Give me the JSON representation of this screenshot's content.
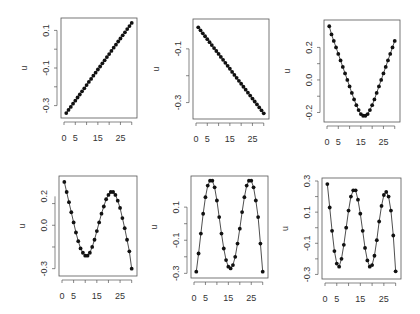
{
  "chart_data": [
    {
      "type": "line",
      "panel": 1,
      "title": "",
      "xlabel": "",
      "ylabel": "u",
      "x_ticks": [
        "0",
        "5",
        "15",
        "25"
      ],
      "y_ticks": [
        "-0.3",
        "-0.1",
        "0.1"
      ],
      "xlim": [
        0,
        31
      ],
      "ylim": [
        -0.35,
        0.15
      ],
      "box": [
        61,
        18,
        137,
        118
      ],
      "x": [
        1,
        2,
        3,
        4,
        5,
        6,
        7,
        8,
        9,
        10,
        11,
        12,
        13,
        14,
        15,
        16,
        17,
        18,
        19,
        20,
        21,
        22,
        23,
        24,
        25,
        26,
        27,
        28,
        29,
        30
      ],
      "values": [
        -0.34,
        -0.323,
        -0.307,
        -0.29,
        -0.274,
        -0.257,
        -0.241,
        -0.224,
        -0.208,
        -0.191,
        -0.174,
        -0.158,
        -0.141,
        -0.125,
        -0.108,
        -0.092,
        -0.075,
        -0.059,
        -0.042,
        -0.026,
        -0.009,
        0.008,
        0.024,
        0.041,
        0.057,
        0.074,
        0.09,
        0.107,
        0.123,
        0.14
      ]
    },
    {
      "type": "line",
      "panel": 2,
      "title": "",
      "xlabel": "",
      "ylabel": "u",
      "x_ticks": [
        "0",
        "5",
        "15",
        "25"
      ],
      "y_ticks": [
        "-0.3",
        "-0.1"
      ],
      "xlim": [
        0,
        31
      ],
      "ylim": [
        -0.35,
        0.0
      ],
      "box": [
        193,
        19,
        269,
        119
      ],
      "x": [
        1,
        2,
        3,
        4,
        5,
        6,
        7,
        8,
        9,
        10,
        11,
        12,
        13,
        14,
        15,
        16,
        17,
        18,
        19,
        20,
        21,
        22,
        23,
        24,
        25,
        26,
        27,
        28,
        29,
        30
      ],
      "values": [
        -0.02,
        -0.031,
        -0.042,
        -0.053,
        -0.064,
        -0.075,
        -0.086,
        -0.097,
        -0.108,
        -0.119,
        -0.13,
        -0.141,
        -0.152,
        -0.163,
        -0.174,
        -0.186,
        -0.197,
        -0.208,
        -0.219,
        -0.23,
        -0.241,
        -0.252,
        -0.263,
        -0.274,
        -0.285,
        -0.296,
        -0.307,
        -0.318,
        -0.329,
        -0.34
      ]
    },
    {
      "type": "line",
      "panel": 3,
      "title": "",
      "xlabel": "",
      "ylabel": "u",
      "x_ticks": [
        "0",
        "5",
        "15",
        "25"
      ],
      "y_ticks": [
        "-0.2",
        "0.0",
        "0.2"
      ],
      "xlim": [
        0,
        31
      ],
      "ylim": [
        -0.24,
        0.35
      ],
      "box": [
        324,
        20,
        400,
        122
      ],
      "x": [
        1,
        2,
        3,
        4,
        5,
        6,
        7,
        8,
        9,
        10,
        11,
        12,
        13,
        14,
        15,
        16,
        17,
        18,
        19,
        20,
        21,
        22,
        23,
        24,
        25,
        26,
        27,
        28,
        29,
        30
      ],
      "values": [
        0.33,
        0.28,
        0.24,
        0.2,
        0.16,
        0.12,
        0.08,
        0.04,
        0.0,
        -0.04,
        -0.08,
        -0.12,
        -0.155,
        -0.185,
        -0.21,
        -0.22,
        -0.22,
        -0.21,
        -0.185,
        -0.155,
        -0.12,
        -0.08,
        -0.04,
        0.0,
        0.04,
        0.08,
        0.12,
        0.16,
        0.2,
        0.24
      ]
    },
    {
      "type": "line",
      "panel": 4,
      "title": "",
      "xlabel": "",
      "ylabel": "u",
      "x_ticks": [
        "0",
        "5",
        "15",
        "25"
      ],
      "y_ticks": [
        "-0.3",
        "0.0",
        "0.2"
      ],
      "xlim": [
        0,
        31
      ],
      "ylim": [
        -0.33,
        0.32
      ],
      "box": [
        59,
        176,
        137,
        276
      ],
      "x": [
        1,
        2,
        3,
        4,
        5,
        6,
        7,
        8,
        9,
        10,
        11,
        12,
        13,
        14,
        15,
        16,
        17,
        18,
        19,
        20,
        21,
        22,
        23,
        24,
        25,
        26,
        27,
        28,
        29,
        30
      ],
      "values": [
        0.3,
        0.23,
        0.16,
        0.09,
        0.02,
        -0.05,
        -0.11,
        -0.16,
        -0.19,
        -0.21,
        -0.21,
        -0.19,
        -0.15,
        -0.1,
        -0.04,
        0.02,
        0.08,
        0.13,
        0.18,
        0.21,
        0.23,
        0.23,
        0.21,
        0.17,
        0.12,
        0.05,
        -0.02,
        -0.1,
        -0.18,
        -0.3
      ]
    },
    {
      "type": "line",
      "panel": 5,
      "title": "",
      "xlabel": "",
      "ylabel": "u",
      "x_ticks": [
        "0",
        "5",
        "15",
        "25"
      ],
      "y_ticks": [
        "-0.3",
        "-0.1",
        "0.1"
      ],
      "xlim": [
        0,
        31
      ],
      "ylim": [
        -0.31,
        0.27
      ],
      "box": [
        191,
        176,
        268,
        278
      ],
      "x": [
        1,
        2,
        3,
        4,
        5,
        6,
        7,
        8,
        9,
        10,
        11,
        12,
        13,
        14,
        15,
        16,
        17,
        18,
        19,
        20,
        21,
        22,
        23,
        24,
        25,
        26,
        27,
        28,
        29,
        30
      ],
      "values": [
        -0.29,
        -0.18,
        -0.06,
        0.06,
        0.16,
        0.23,
        0.26,
        0.26,
        0.22,
        0.14,
        0.04,
        -0.06,
        -0.15,
        -0.22,
        -0.26,
        -0.27,
        -0.25,
        -0.2,
        -0.12,
        -0.03,
        0.07,
        0.16,
        0.23,
        0.26,
        0.26,
        0.22,
        0.14,
        0.04,
        -0.12,
        -0.29
      ]
    },
    {
      "type": "line",
      "panel": 6,
      "title": "",
      "xlabel": "",
      "ylabel": "u",
      "x_ticks": [
        "0",
        "5",
        "15",
        "25"
      ],
      "y_ticks": [
        "-0.3",
        "-0.1",
        "0.1",
        "0.3"
      ],
      "xlim": [
        0,
        31
      ],
      "ylim": [
        -0.31,
        0.3
      ],
      "box": [
        322,
        178,
        401,
        279
      ],
      "x": [
        1,
        2,
        3,
        4,
        5,
        6,
        7,
        8,
        9,
        10,
        11,
        12,
        13,
        14,
        15,
        16,
        17,
        18,
        19,
        20,
        21,
        22,
        23,
        24,
        25,
        26,
        27,
        28,
        29,
        30
      ],
      "values": [
        0.28,
        0.13,
        -0.02,
        -0.15,
        -0.23,
        -0.25,
        -0.2,
        -0.11,
        0.0,
        0.11,
        0.2,
        0.24,
        0.24,
        0.18,
        0.09,
        -0.02,
        -0.13,
        -0.21,
        -0.25,
        -0.24,
        -0.18,
        -0.08,
        0.04,
        0.14,
        0.21,
        0.23,
        0.2,
        0.11,
        -0.05,
        -0.28
      ]
    }
  ]
}
